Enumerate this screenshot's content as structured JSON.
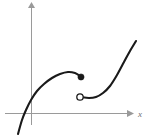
{
  "figure": {
    "title": "",
    "background_color": "#ffffff",
    "width": 151,
    "height": 135
  },
  "axes": {
    "x_axis": {
      "label": "x",
      "color": "#9a9a9a",
      "y_pixel": 113,
      "x_start": 5,
      "x_end": 131,
      "arrow": "right"
    },
    "y_axis": {
      "label": "",
      "color": "#9a9a9a",
      "x_pixel": 31,
      "y_start": 125,
      "y_end": 3,
      "arrow": "up"
    }
  },
  "chart_data": {
    "type": "line",
    "title": "",
    "xlabel": "x",
    "ylabel": "",
    "grid": false,
    "legend": null,
    "curve_color": "#1a1a1a",
    "series": [
      {
        "name": "left-branch",
        "style": "solid",
        "endpoint_start": "none",
        "endpoint_end": "filled",
        "points": [
          [
            18,
            134
          ],
          [
            22,
            120
          ],
          [
            26,
            110
          ],
          [
            31,
            100
          ],
          [
            37,
            91
          ],
          [
            44,
            84
          ],
          [
            52,
            78
          ],
          [
            60,
            74
          ],
          [
            68,
            72
          ],
          [
            75,
            73
          ],
          [
            80,
            76
          ]
        ]
      },
      {
        "name": "right-branch",
        "style": "solid",
        "endpoint_start": "open",
        "endpoint_end": "none",
        "points": [
          [
            81,
            97
          ],
          [
            89,
            98
          ],
          [
            96,
            97
          ],
          [
            103,
            93
          ],
          [
            110,
            86
          ],
          [
            117,
            75
          ],
          [
            124,
            62
          ],
          [
            130,
            51
          ],
          [
            136,
            41
          ]
        ]
      }
    ],
    "markers": [
      {
        "name": "closed-endpoint",
        "type": "filled-dot",
        "x_pixel": 81,
        "y_pixel": 77,
        "radius": 3.1,
        "color": "#1a1a1a",
        "meaning": "function value included at this point"
      },
      {
        "name": "open-endpoint",
        "type": "open-circle",
        "x_pixel": 80,
        "y_pixel": 97,
        "radius": 3.2,
        "color": "#1a1a1a",
        "meaning": "function value excluded at this point"
      }
    ]
  }
}
